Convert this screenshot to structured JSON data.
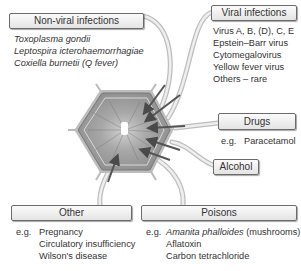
{
  "diagram": {
    "type": "causes-of-liver-damage",
    "center": {
      "shape": "hepatocyte-hexagon",
      "fill": "#9a9a9a"
    },
    "categories": [
      {
        "title": "Non-viral infections",
        "items": [
          "Toxoplasma gondii",
          "Leptospira icterohaemorrhagiae",
          "Coxiella burnetii (Q fever)"
        ],
        "prefix": ""
      },
      {
        "title": "Viral infections",
        "items": [
          "Virus A, B, (D), C, E",
          "Epstein–Barr virus",
          "Cytomegalovirus",
          "Yellow fever virus",
          "Others – rare"
        ],
        "prefix": ""
      },
      {
        "title": "Drugs",
        "prefix": "e.g.",
        "items": [
          "Paracetamol"
        ]
      },
      {
        "title": "Alcohol",
        "prefix": "",
        "items": []
      },
      {
        "title": "Other",
        "prefix": "e.g.",
        "items": [
          "Pregnancy",
          "Circulatory insufficiency",
          "Wilson's disease"
        ]
      },
      {
        "title": "Poisons",
        "prefix": "e.g.",
        "items": [
          "Amanita phalloides",
          "(mushrooms)",
          "Aflatoxin",
          "Carbon tetrachloride"
        ]
      }
    ],
    "colors": {
      "arrow": "#5a5a5a",
      "connector": "#c8c8c8",
      "box_border": "#6b6b6b"
    }
  }
}
